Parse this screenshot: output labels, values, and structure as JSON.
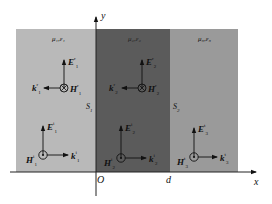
{
  "colors": {
    "region1": "#b9b9b9",
    "region2": "#5b5b5b",
    "region3": "#9a9a9a",
    "axis": "#222222",
    "background": "#ffffff"
  },
  "axes": {
    "x_label": "x",
    "y_label": "y",
    "origin_label": "O",
    "d_label": "d"
  },
  "surfaces": {
    "s1": "S",
    "s1_sub": "1",
    "s2": "S",
    "s2_sub": "2"
  },
  "regions": [
    {
      "media": "μ₁,ε₁",
      "reflected": {
        "E": "E",
        "E_sup": "r",
        "E_sub": "1",
        "H": "H",
        "H_sup": "r",
        "H_sub": "1",
        "k": "k",
        "k_sup": "r",
        "k_sub": "1",
        "H_icon": "into-page-cross"
      },
      "incident": {
        "E": "E",
        "E_sup": "i",
        "E_sub": "1",
        "H": "H",
        "H_sup": "i",
        "H_sub": "1",
        "k": "k",
        "k_sup": "i",
        "k_sub": "1",
        "H_icon": "out-of-page-dot"
      }
    },
    {
      "media": "μ₂,ε₂",
      "reflected": {
        "E": "E",
        "E_sup": "r",
        "E_sub": "2",
        "H": "H",
        "H_sup": "r",
        "H_sub": "2",
        "k": "k",
        "k_sup": "r",
        "k_sub": "2",
        "H_icon": "into-page-cross"
      },
      "incident": {
        "E": "E",
        "E_sup": "i",
        "E_sub": "2",
        "H": "H",
        "H_sup": "i",
        "H_sub": "2",
        "k": "k",
        "k_sup": "i",
        "k_sub": "2",
        "H_icon": "out-of-page-dot"
      }
    },
    {
      "media": "μ₃,ε₃",
      "transmitted": {
        "E": "E",
        "E_sup": "t",
        "E_sub": "3",
        "H": "H",
        "H_sup": "t",
        "H_sub": "3",
        "k": "k",
        "k_sup": "t",
        "k_sub": "3",
        "H_icon": "out-of-page-dot"
      }
    }
  ]
}
